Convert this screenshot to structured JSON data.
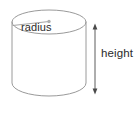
{
  "figure": {
    "name": "cylinder-diagram",
    "shape": "cylinder",
    "background_color": "#ffffff",
    "stroke_color": "#9a9a9a",
    "text_color": "#2b2b2b",
    "labels": {
      "radius": "radius",
      "height": "height"
    },
    "annotations": {
      "radius_line": {
        "icon": "radius-line",
        "from": "ellipse-left-edge",
        "to": "ellipse-center-point"
      },
      "center_point": {
        "icon": "center-dot"
      },
      "height_arrow": {
        "icon": "double-headed-vertical-arrow",
        "from": "top-of-cylinder",
        "to": "bottom-of-cylinder"
      }
    },
    "geometry": {
      "top_ellipse": {
        "cx": 49,
        "cy": 22,
        "rx": 37,
        "ry": 12
      },
      "body_left_x": 12,
      "body_right_x": 86,
      "body_top_y": 22,
      "body_bottom_y": 95,
      "height_arrow_x": 95,
      "height_arrow_top_y": 25,
      "height_arrow_bottom_y": 93
    }
  }
}
